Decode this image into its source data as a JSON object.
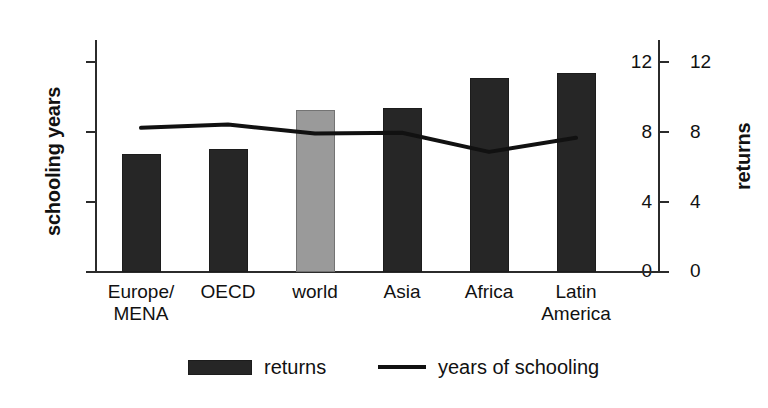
{
  "chart_data": {
    "type": "bar",
    "title": "",
    "subtitle": "",
    "xlabel": "",
    "ylabel": "schooling years",
    "ylabel_right": "returns",
    "categories": [
      "Europe/\nMENA",
      "OECD",
      "world",
      "Asia",
      "Africa",
      "Latin\nAmerica"
    ],
    "category_plain": [
      "Europe/MENA",
      "OECD",
      "world",
      "Asia",
      "Africa",
      "Latin America"
    ],
    "ylim": [
      0,
      14
    ],
    "ylim_right": [
      0,
      14
    ],
    "yticks": [
      "0",
      "4",
      "8",
      "12"
    ],
    "yticks_right": [
      "0",
      "4",
      "8",
      "12"
    ],
    "grid": false,
    "legend_position": "bottom",
    "series": [
      {
        "name": "returns",
        "kind": "bar",
        "axis": "right",
        "values": [
          7.1,
          7.4,
          9.8,
          9.9,
          11.7,
          12.0
        ],
        "colors": [
          "#262626",
          "#262626",
          "#9a9a9a",
          "#262626",
          "#262626",
          "#262626"
        ]
      },
      {
        "name": "years of schooling",
        "kind": "line",
        "axis": "left",
        "values": [
          8.7,
          8.9,
          8.35,
          8.4,
          7.25,
          8.1
        ],
        "color": "#111111"
      }
    ]
  },
  "axes": {
    "left": {
      "title": "schooling years",
      "ticks": [
        "12",
        "8",
        "4",
        "0"
      ]
    },
    "right": {
      "title": "returns",
      "ticks": [
        "12",
        "8",
        "4",
        "0"
      ]
    }
  },
  "categories": [
    {
      "label": "Europe/\nMENA"
    },
    {
      "label": "OECD"
    },
    {
      "label": "world"
    },
    {
      "label": "Asia"
    },
    {
      "label": "Africa"
    },
    {
      "label": "Latin\nAmerica"
    }
  ],
  "legend": {
    "returns_label": "returns",
    "schooling_label": "years of schooling",
    "bar_color": "#262626",
    "line_color": "#111111"
  },
  "colors": {
    "bar_dark": "#262626",
    "bar_highlight": "#9a9a9a",
    "axis": "#2b2b2b",
    "background": "#ffffff"
  }
}
